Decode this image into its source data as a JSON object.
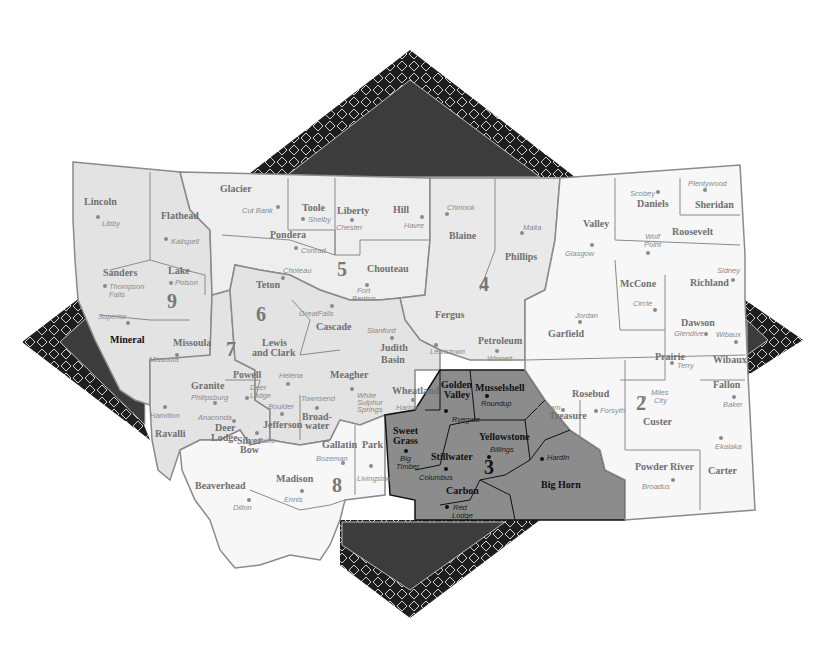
{
  "map": {
    "title": "Montana Regions Map",
    "colors": {
      "background": "#ffffff",
      "region_light": "#e6e6e6",
      "region_white": "#f7f7f7",
      "region_3_highlight": "#8c8c8c",
      "star_outer": "#1e1e1e",
      "star_inner": "#3c3c3c",
      "border": "#8a8a8a"
    },
    "regions": [
      {
        "number": "2",
        "label": "2",
        "counties": [
          "Garfield",
          "McCone",
          "Richland",
          "Dawson",
          "Prairie",
          "Wibaux",
          "Fallon",
          "Custer",
          "Rosebud",
          "Treasure",
          "Powder River",
          "Carter"
        ]
      },
      {
        "number": "3",
        "label": "3",
        "counties": [
          "Golden Valley",
          "Musselshell",
          "Sweet Grass",
          "Stillwater",
          "Yellowstone",
          "Carbon",
          "Big Horn"
        ],
        "highlighted": true
      },
      {
        "number": "4",
        "label": "4",
        "counties": [
          "Blaine",
          "Phillips",
          "Fergus",
          "Petroleum"
        ]
      },
      {
        "number": "5",
        "label": "5",
        "counties": [
          "Glacier",
          "Toole",
          "Liberty",
          "Hill",
          "Pondera",
          "Teton",
          "Chouteau",
          "Cascade",
          "Judith Basin"
        ]
      },
      {
        "number": "6",
        "label": "6",
        "counties": [
          "Lewis and Clark",
          "Meagher",
          "Jefferson",
          "Broadwater",
          "Wheatland"
        ]
      },
      {
        "number": "7",
        "label": "7",
        "counties": [
          "Powell",
          "Granite",
          "Deer Lodge",
          "Silver Bow",
          "Ravalli"
        ]
      },
      {
        "number": "8",
        "label": "8",
        "counties": [
          "Gallatin",
          "Park",
          "Madison",
          "Beaverhead"
        ]
      },
      {
        "number": "9",
        "label": "9",
        "counties": [
          "Lincoln",
          "Flathead",
          "Sanders",
          "Lake",
          "Mineral",
          "Missoula"
        ]
      }
    ],
    "counties": [
      {
        "name": "Lincoln",
        "city": "Libby"
      },
      {
        "name": "Flathead",
        "city": "Kalispell"
      },
      {
        "name": "Sanders",
        "city": "Thompson Falls"
      },
      {
        "name": "Lake",
        "city": "Polson"
      },
      {
        "name": "Mineral",
        "city": "Superior"
      },
      {
        "name": "Missoula",
        "city": "Missoula"
      },
      {
        "name": "Glacier",
        "city": "Cut Bank"
      },
      {
        "name": "Toole",
        "city": "Shelby"
      },
      {
        "name": "Liberty",
        "city": "Chester"
      },
      {
        "name": "Hill",
        "city": "Havre"
      },
      {
        "name": "Blaine",
        "city": "Chinook"
      },
      {
        "name": "Phillips",
        "city": "Malta"
      },
      {
        "name": "Valley",
        "city": "Glasgow"
      },
      {
        "name": "Daniels",
        "city": "Scobey"
      },
      {
        "name": "Sheridan",
        "city": "Plentywood"
      },
      {
        "name": "Roosevelt",
        "city": "Wolf Point"
      },
      {
        "name": "Pondera",
        "city": "Conrad"
      },
      {
        "name": "Teton",
        "city": "Choteau"
      },
      {
        "name": "Chouteau",
        "city": "Fort Benton"
      },
      {
        "name": "Cascade",
        "city": "Great Falls"
      },
      {
        "name": "Judith Basin",
        "city": "Stanford"
      },
      {
        "name": "Fergus",
        "city": "Lewistown"
      },
      {
        "name": "Petroleum",
        "city": "Winnett"
      },
      {
        "name": "Garfield",
        "city": "Jordan"
      },
      {
        "name": "McCone",
        "city": "Circle"
      },
      {
        "name": "Richland",
        "city": "Sidney"
      },
      {
        "name": "Dawson",
        "city": "Glendive"
      },
      {
        "name": "Prairie",
        "city": "Terry"
      },
      {
        "name": "Wibaux",
        "city": "Wibaux"
      },
      {
        "name": "Lewis and Clark",
        "city": "Helena"
      },
      {
        "name": "Powell",
        "city": "Deer Lodge"
      },
      {
        "name": "Granite",
        "city": "Philipsburg"
      },
      {
        "name": "Deer Lodge",
        "city": "Anaconda"
      },
      {
        "name": "Silver Bow",
        "city": "Butte"
      },
      {
        "name": "Jefferson",
        "city": "Boulder"
      },
      {
        "name": "Broadwater",
        "city": "Townsend"
      },
      {
        "name": "Meagher",
        "city": "White Sulphur Springs"
      },
      {
        "name": "Wheatland",
        "city": "Harlowton"
      },
      {
        "name": "Golden Valley",
        "city": "Ryegate"
      },
      {
        "name": "Musselshell",
        "city": "Roundup"
      },
      {
        "name": "Sweet Grass",
        "city": "Big Timber"
      },
      {
        "name": "Stillwater",
        "city": "Columbus"
      },
      {
        "name": "Yellowstone",
        "city": "Billings"
      },
      {
        "name": "Carbon",
        "city": "Red Lodge"
      },
      {
        "name": "Big Horn",
        "city": "Hardin"
      },
      {
        "name": "Treasure",
        "city": "Hysham"
      },
      {
        "name": "Rosebud",
        "city": "Forsyth"
      },
      {
        "name": "Custer",
        "city": "Miles City"
      },
      {
        "name": "Fallon",
        "city": "Baker"
      },
      {
        "name": "Powder River",
        "city": "Broadus"
      },
      {
        "name": "Carter",
        "city": "Ekalaka"
      },
      {
        "name": "Ravalli",
        "city": "Hamilton"
      },
      {
        "name": "Gallatin",
        "city": "Bozeman"
      },
      {
        "name": "Park",
        "city": "Livingston"
      },
      {
        "name": "Madison",
        "city": "Ennis"
      },
      {
        "name": "Beaverhead",
        "city": "Dillon"
      }
    ],
    "labels": {
      "lincoln": "Lincoln",
      "libby": "Libby",
      "flathead": "Flathead",
      "kalispell": "Kalispell",
      "sanders": "Sanders",
      "thompson": "Thompson",
      "falls": "Falls",
      "lake": "Lake",
      "polson": "Polson",
      "mineral": "Mineral",
      "superior": "Superior",
      "missoula": "Missoula",
      "missoula_city": "Missoula",
      "glacier": "Glacier",
      "cutbank": "Cut Bank",
      "toole": "Toole",
      "shelby": "Shelby",
      "liberty": "Liberty",
      "chester": "Chester",
      "hill": "Hill",
      "havre": "Havre",
      "blaine": "Blaine",
      "chinook": "Chinook",
      "phillips": "Phillips",
      "malta": "Malta",
      "valley": "Valley",
      "glasgow": "Glasgow",
      "daniels": "Daniels",
      "scobey": "Scobey",
      "sheridan": "Sheridan",
      "plentywood": "Plentywood",
      "roosevelt": "Roosevelt",
      "wolf": "Wolf",
      "point": "Point",
      "pondera": "Pondera",
      "conrad": "Conrad",
      "teton": "Teton",
      "choteau": "Choteau",
      "chouteau": "Chouteau",
      "fort": "Fort",
      "benton": "Benton",
      "cascade": "Cascade",
      "greatfalls": "GreatFalls",
      "judith": "Judith",
      "basin": "Basin",
      "stanford": "Stanford",
      "fergus": "Fergus",
      "lewistown": "Lewistown",
      "petroleum": "Petroleum",
      "winnett": "Winnett",
      "garfield": "Garfield",
      "jordan": "Jordan",
      "mccone": "McCone",
      "circle": "Circle",
      "richland": "Richland",
      "sidney": "Sidney",
      "dawson": "Dawson",
      "glendive": "Glendive",
      "prairie": "Prairie",
      "terry": "Terry",
      "wibaux": "Wibaux",
      "wibaux_city": "Wibaux",
      "lewis": "Lewis",
      "andclark": "and Clark",
      "helena": "Helena",
      "powell": "Powell",
      "deer": "Deer",
      "lodge_city": "Lodge",
      "granite": "Granite",
      "philipsburg": "Philipsburg",
      "deerlodge1": "Deer",
      "deerlodge2": "Lodge",
      "anaconda": "Anaconda",
      "silver": "Silver",
      "bow": "Bow",
      "butte": "Butte",
      "jefferson": "Jefferson",
      "boulder": "Boulder",
      "broad": "Broad-",
      "water": "water",
      "townsend": "Townsend",
      "meagher": "Meagher",
      "white": "White",
      "sulphur": "Sulphur",
      "springs": "Springs",
      "wheatland": "Wheatland",
      "harlowton": "Harlowton",
      "golden": "Golden",
      "valley2": "Valley",
      "ryegate": "Ryegate",
      "musselshell": "Musselshell",
      "roundup": "Roundup",
      "sweet": "Sweet",
      "grass": "Grass",
      "big": "Big",
      "timber": "Timber",
      "stillwater": "Stillwater",
      "columbus": "Columbus",
      "yellowstone": "Yellowstone",
      "billings": "Billings",
      "carbon": "Carbon",
      "red": "Red",
      "lodge": "Lodge",
      "bighorn": "Big Horn",
      "hardin": "Hardin",
      "treasure": "Treasure",
      "hysham": "Hysham",
      "rosebud": "Rosebud",
      "forsyth": "Forsyth",
      "custer": "Custer",
      "miles": "Miles",
      "city": "City",
      "fallon": "Fallon",
      "baker": "Baker",
      "powderriver": "Powder River",
      "broadus": "Broadus",
      "carter": "Carter",
      "ekalaka": "Ekalaka",
      "ravalli": "Ravalli",
      "hamilton": "Hamilton",
      "gallatin": "Gallatin",
      "bozeman": "Bozeman",
      "park": "Park",
      "livingston": "Livingston",
      "madison": "Madison",
      "ennis": "Ennis",
      "beaverhead": "Beaverhead",
      "dillon": "Dillon"
    }
  }
}
